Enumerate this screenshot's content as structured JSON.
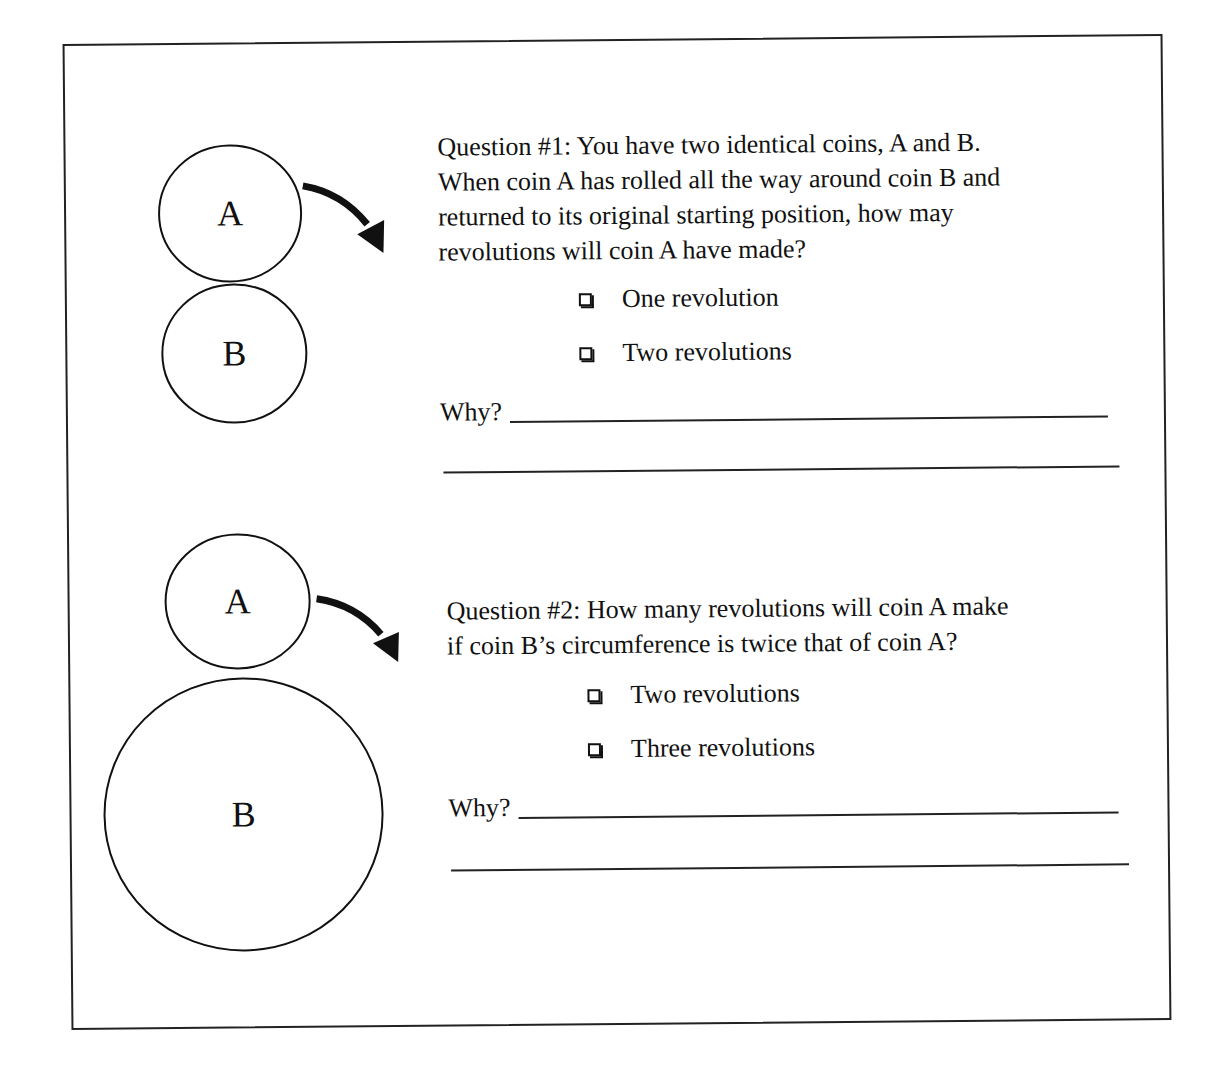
{
  "question1": {
    "text_lines": [
      "Question #1:  You have two identical coins, A and B.",
      "When coin A has rolled all the way around coin B and",
      "returned to its original starting position, how may",
      "revolutions will coin A have made?"
    ],
    "options": [
      "One revolution",
      "Two revolutions"
    ],
    "why_label": "Why?",
    "diagram": {
      "coins": [
        {
          "label": "A",
          "cx": 234,
          "cy": 209,
          "r": 70
        },
        {
          "label": "B",
          "cx": 236,
          "cy": 349,
          "r": 70
        }
      ],
      "arrow": "curved-arrow-clockwise"
    }
  },
  "question2": {
    "text_lines": [
      "Question #2:  How many revolutions will coin A make",
      "if coin B’s circumference is twice that of coin A?"
    ],
    "options": [
      "Two revolutions",
      "Three revolutions"
    ],
    "why_label": "Why?",
    "diagram": {
      "coins": [
        {
          "label": "A",
          "cx": 237,
          "cy": 600,
          "r": 72
        },
        {
          "label": "B",
          "cx": 241,
          "cy": 811,
          "r": 138
        }
      ],
      "arrow": "curved-arrow-clockwise"
    }
  }
}
